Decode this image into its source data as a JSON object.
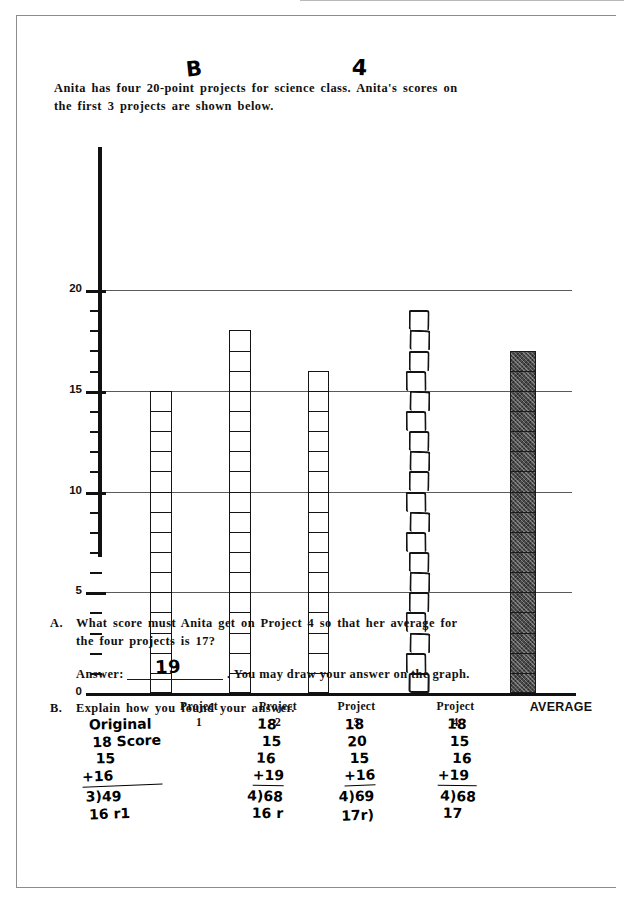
{
  "document": {
    "type": "scanned-math-worksheet",
    "prompt_line1": "Anita has four 20-point projects for science class.   Anita's scores on",
    "prompt_line2": "the first 3 projects are shown below.",
    "handwritten_marks": [
      {
        "name": "hw-mark-b",
        "text": "B"
      },
      {
        "name": "hw-mark-4",
        "text": "4"
      }
    ]
  },
  "chart_data": {
    "type": "bar",
    "title": "",
    "xlabel": "",
    "ylabel": "",
    "ylim": [
      0,
      20
    ],
    "yticks_major": [
      0,
      5,
      10,
      15,
      20
    ],
    "ytick_labels": [
      "0",
      "5",
      "10",
      "15",
      "20"
    ],
    "ytick_minor_step": 1,
    "grid": true,
    "gridlines_at": [
      5,
      10,
      15,
      20
    ],
    "legend": "none",
    "categories": [
      "Project\n1",
      "Project\n2",
      "Project\n3",
      "Project\n4",
      "AVERAGE"
    ],
    "category_labels": [
      {
        "line1": "Project",
        "line2": "1"
      },
      {
        "line1": "Project",
        "line2": "2"
      },
      {
        "line1": "Project",
        "line2": "3"
      },
      {
        "line1": "Project",
        "line2": "4"
      },
      {
        "line1": "AVERAGE",
        "line2": ""
      }
    ],
    "values": [
      15,
      18,
      16,
      19,
      17
    ],
    "bar_styles": [
      "unit-squares",
      "unit-squares",
      "unit-squares",
      "hand-drawn-unit-squares",
      "filled-unit-squares"
    ]
  },
  "questions": {
    "a": {
      "letter": "A.",
      "line1": "What score must Anita get on Project 4 so that her average for",
      "line2": "the four projects is 17?",
      "answer_label": "Answer:",
      "answer_value": "19",
      "answer_suffix": ".   You may draw your answer on the graph."
    },
    "b": {
      "letter": "B.",
      "text": "Explain how you found your answer."
    }
  },
  "student_work": {
    "column1": {
      "name": "work-column-1",
      "lines": [
        "Original",
        "18 Score",
        "15",
        "+16",
        "3)49",
        "16 r1"
      ]
    },
    "column2": {
      "name": "work-column-2",
      "lines": [
        "18",
        "15",
        "16",
        "+19",
        "4)68",
        "16 r"
      ]
    },
    "column3": {
      "name": "work-column-3",
      "lines": [
        "18",
        "20",
        "15",
        "+16",
        "4)69",
        "17r)"
      ]
    },
    "column4": {
      "name": "work-column-4",
      "lines": [
        "18",
        "15",
        "16",
        "+19",
        "4)68",
        "17"
      ]
    }
  },
  "colors": {
    "ink": "#111111",
    "paper": "#ffffff",
    "gridline": "#5a5a5a",
    "average_bar_fill": "#4b4b4b",
    "frame": "#8d8d8d"
  }
}
